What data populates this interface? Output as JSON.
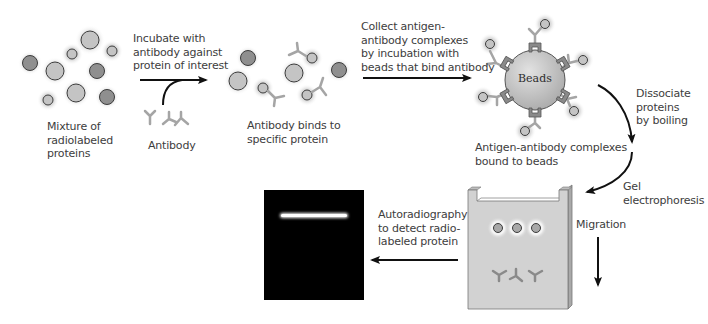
{
  "diagram": {
    "colors": {
      "arrow": "#111111",
      "protein_light": "#c4c4c4",
      "protein_dark": "#8f8f8f",
      "protein_stroke": "#3c3c3c",
      "antibody": "#a5a5a5",
      "bead_fill": "#c9c9c9",
      "bead_tab": "#8a8a8a",
      "gel_fill": "#d2d2d2",
      "film": "#000000",
      "band": "#ffffff",
      "text": "#3d3d3d"
    },
    "steps": [
      {
        "id": "mixture",
        "label_lines": [
          "Mixture of",
          "radiolabeled",
          "proteins"
        ]
      },
      {
        "id": "incubate",
        "label_lines": [
          "Incubate with",
          "antibody against",
          "protein of interest"
        ]
      },
      {
        "id": "antibody",
        "label_lines": [
          "Antibody"
        ]
      },
      {
        "id": "binds",
        "label_lines": [
          "Antibody binds to",
          "specific protein"
        ]
      },
      {
        "id": "collect",
        "label_lines": [
          "Collect antigen-",
          "antibody complexes",
          "by incubation with",
          "beads that bind antibody"
        ]
      },
      {
        "id": "beads",
        "label": "Beads"
      },
      {
        "id": "bound",
        "label_lines": [
          "Antigen-antibody complexes",
          "bound to beads"
        ]
      },
      {
        "id": "dissociate",
        "label_lines": [
          "Dissociate",
          "proteins",
          "by boiling"
        ]
      },
      {
        "id": "gel",
        "label_lines": [
          "Gel",
          "electrophoresis"
        ]
      },
      {
        "id": "migration",
        "label_lines": [
          "Migration"
        ]
      },
      {
        "id": "autorad",
        "label_lines": [
          "Autoradiography",
          "to detect radio-",
          "labeled protein"
        ]
      }
    ]
  }
}
